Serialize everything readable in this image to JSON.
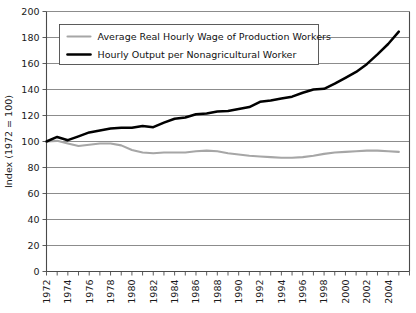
{
  "chart_data": {
    "type": "line",
    "title": "",
    "xlabel": "",
    "ylabel": "Index (1972 = 100)",
    "ylim": [
      0,
      200
    ],
    "xlim": [
      1972,
      2006
    ],
    "ytick_step": 20,
    "xtick_step": 2,
    "grid": true,
    "legend_position": "top-left",
    "yticks": [
      "0",
      "20",
      "40",
      "60",
      "80",
      "100",
      "120",
      "140",
      "160",
      "180",
      "200"
    ],
    "xticks": [
      "1972",
      "1974",
      "1976",
      "1978",
      "1980",
      "1982",
      "1984",
      "1986",
      "1988",
      "1990",
      "1992",
      "1994",
      "1996",
      "1998",
      "2000",
      "2002",
      "2004"
    ],
    "x": [
      1972,
      1973,
      1974,
      1975,
      1976,
      1977,
      1978,
      1979,
      1980,
      1981,
      1982,
      1983,
      1984,
      1985,
      1986,
      1987,
      1988,
      1989,
      1990,
      1991,
      1992,
      1993,
      1994,
      1995,
      1996,
      1997,
      1998,
      1999,
      2000,
      2001,
      2002,
      2003,
      2004,
      2005
    ],
    "series": [
      {
        "name": "Average Real Hourly Wage of Production Workers",
        "color": "#a6a6a6",
        "values": [
          100,
          100.5,
          98.5,
          96.5,
          97.5,
          98.5,
          98.5,
          97,
          93.5,
          91.5,
          91,
          91.5,
          91.5,
          91.5,
          92.5,
          93,
          92.5,
          91,
          90,
          89,
          88.5,
          88,
          87.5,
          87.5,
          88,
          89,
          90.5,
          91.5,
          92,
          92.5,
          93,
          93,
          92.5,
          92
        ]
      },
      {
        "name": "Hourly Output per Nonagricultural Worker",
        "color": "#000000",
        "values": [
          100,
          103.5,
          101,
          104,
          107,
          108.5,
          110,
          110.5,
          110.5,
          112,
          111,
          114.5,
          117.5,
          118.5,
          121,
          121.5,
          123,
          123.5,
          125,
          126.5,
          130.5,
          131.5,
          133,
          134.5,
          137.5,
          140,
          140.5,
          144.5,
          149,
          153.5,
          159.5,
          167,
          175,
          184.5
        ]
      }
    ],
    "legend": [
      {
        "label": "Average Real Hourly Wage of Production Workers",
        "color": "#a6a6a6"
      },
      {
        "label": "Hourly Output per Nonagricultural Worker",
        "color": "#000000"
      }
    ]
  }
}
